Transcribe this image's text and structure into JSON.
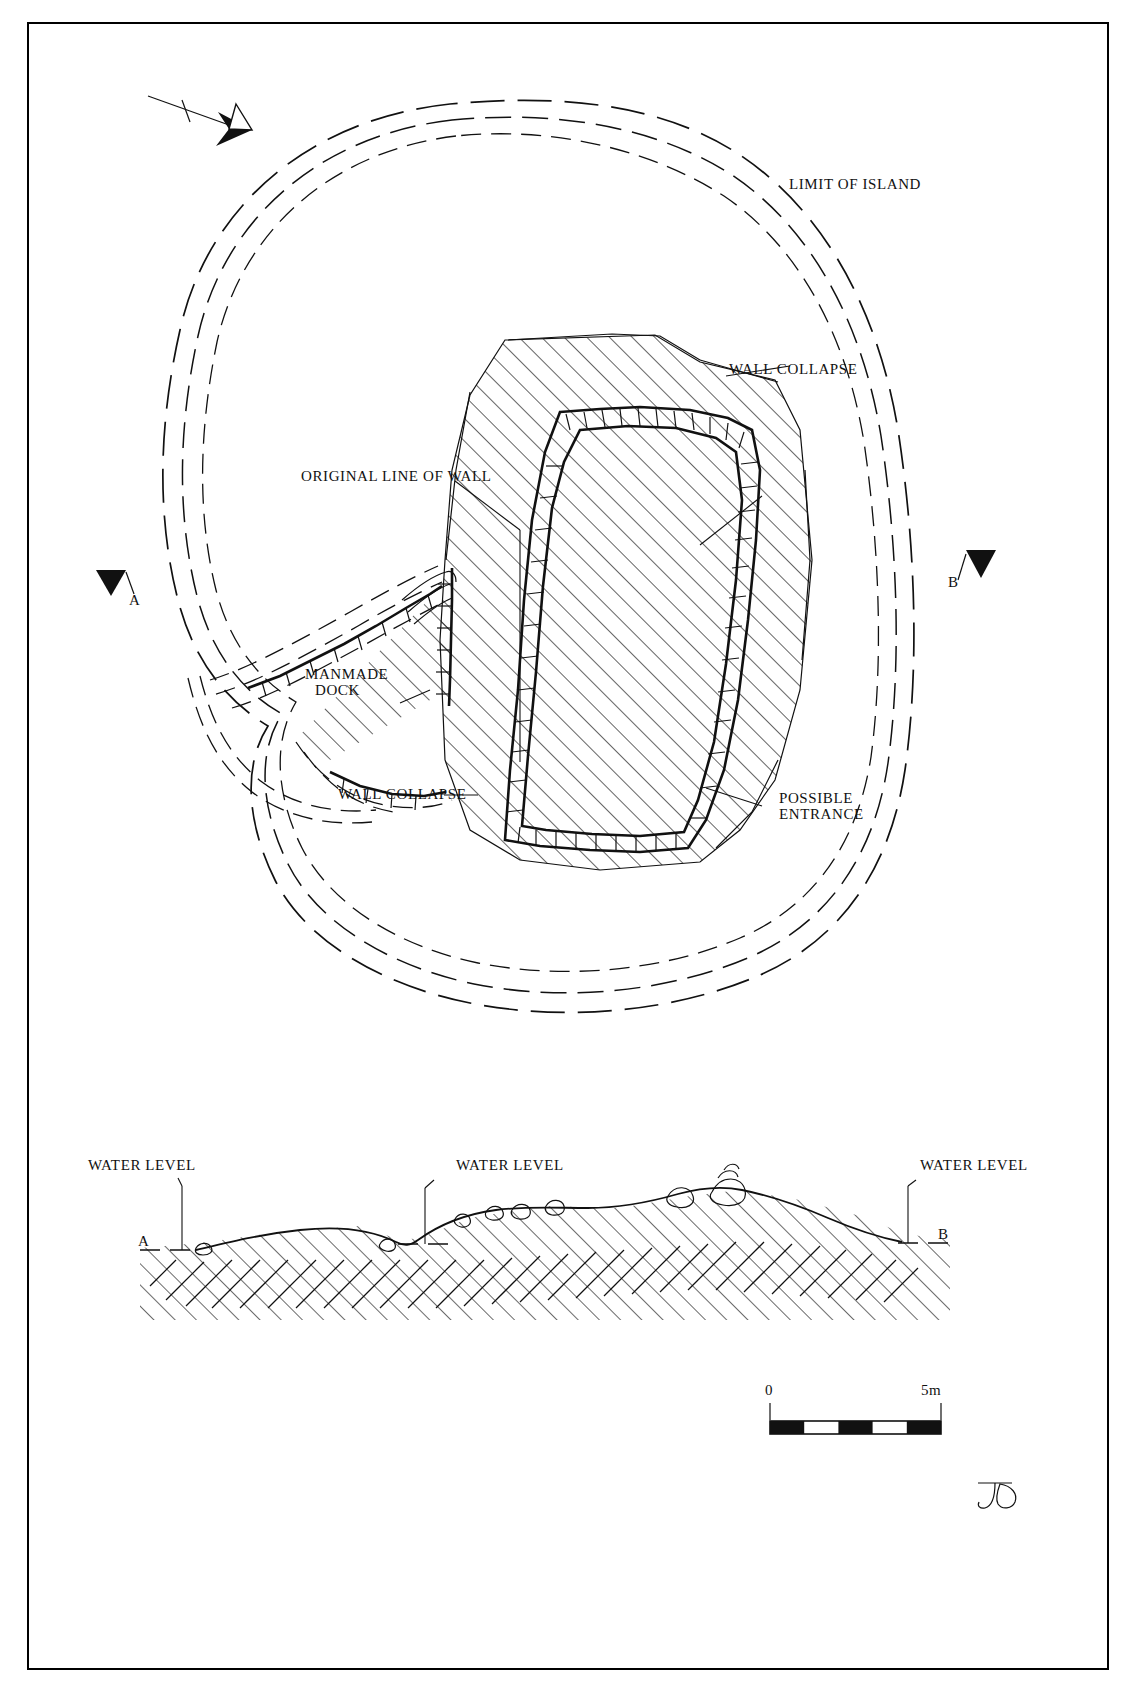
{
  "drawing": {
    "type": "archaeological-site-plan",
    "title_visible": false,
    "sheet": {
      "width": 1137,
      "height": 1696,
      "background": "#ffffff",
      "ink": "#111111"
    }
  },
  "north_arrow": {
    "label": "N",
    "direction": "arrow points to lower-right toward N"
  },
  "plan_labels": {
    "limit_of_island": "LIMIT OF ISLAND",
    "wall_collapse_upper": "WALL COLLAPSE",
    "wall_collapse_lower": "WALL COLLAPSE",
    "original_line_of_wall": "ORIGINAL LINE OF WALL",
    "manmade_dock_line1": "MANMADE",
    "manmade_dock_line2": "DOCK",
    "possible_entrance_line1": "POSSIBLE",
    "possible_entrance_line2": "ENTRANCE"
  },
  "section_markers": {
    "left": "A",
    "right": "B",
    "section_left": "A",
    "section_right": "B"
  },
  "section_labels": {
    "water_level_left": "WATER LEVEL",
    "water_level_middle": "WATER LEVEL",
    "water_level_right": "WATER LEVEL"
  },
  "scale_bar": {
    "start": "0",
    "end": "5m",
    "divisions": 5,
    "unit": "m",
    "total_length_m": 5
  },
  "signature": {
    "monogram": "JD"
  }
}
